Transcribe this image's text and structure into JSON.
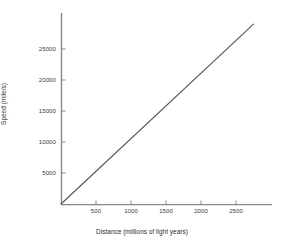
{
  "chart_data": {
    "type": "line",
    "title": "",
    "xlabel": "Distance (millions of light years)",
    "ylabel": "Speed (mile/s)",
    "xlim": [
      0,
      3000
    ],
    "ylim": [
      0,
      30000
    ],
    "xticks": [
      500,
      1000,
      1500,
      2000,
      2500
    ],
    "xtick_labels": [
      "500",
      "1000",
      "1500",
      "2000",
      "2500"
    ],
    "yticks": [
      5000,
      10000,
      15000,
      20000,
      25000
    ],
    "ytick_labels": [
      "5000",
      "10000",
      "15000",
      "20000",
      "25000"
    ],
    "grid": false,
    "legend": false,
    "series": [
      {
        "name": "speed vs distance",
        "x": [
          0,
          250,
          500,
          750,
          1000,
          1250,
          1500,
          1750,
          2000,
          2250,
          2500,
          2750
        ],
        "values": [
          0,
          2640,
          5270,
          7910,
          10540,
          13180,
          15820,
          18450,
          21090,
          23730,
          26360,
          29000
        ],
        "color": "#555555"
      }
    ],
    "slope": 10.55,
    "slope_units": "mile/s per million light years"
  },
  "style": {
    "background": "#ffffff",
    "axis_color": "#888888",
    "line_color": "#555555",
    "text_color": "#333333"
  },
  "axes": {
    "x_title": "Distance (millions of light years)",
    "y_title": "Speed (mile/s)"
  }
}
